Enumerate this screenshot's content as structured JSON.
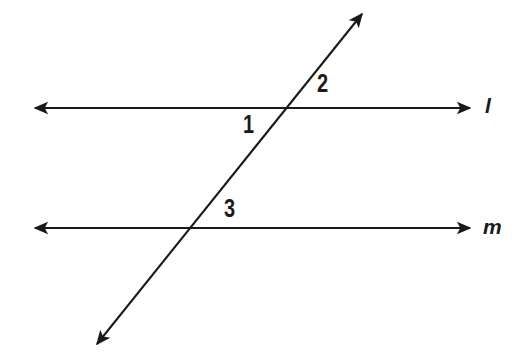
{
  "figure": {
    "type": "geometry-diagram",
    "background_color": "#ffffff",
    "stroke_color": "#1a1a1a",
    "canvas": {
      "width": 523,
      "height": 363
    }
  },
  "lines": [
    {
      "id": "line-l",
      "name": "l",
      "label": "l",
      "orientation": "horizontal",
      "label_style": "italic",
      "arrowheads": "both",
      "x1": 35,
      "y1": 108,
      "x2": 470,
      "y2": 108,
      "label_x": 485,
      "label_y": 95
    },
    {
      "id": "line-m",
      "name": "m",
      "label": "m",
      "orientation": "horizontal",
      "label_style": "italic",
      "arrowheads": "both",
      "x1": 35,
      "y1": 228,
      "x2": 470,
      "y2": 228,
      "label_x": 483,
      "label_y": 216
    },
    {
      "id": "transversal",
      "name": "transversal",
      "label": "",
      "orientation": "oblique",
      "label_style": "none",
      "arrowheads": "both",
      "x1": 97,
      "y1": 344,
      "x2": 362,
      "y2": 14,
      "label_x": 0,
      "label_y": 0
    }
  ],
  "intersections": [
    {
      "id": "intersection-l",
      "lines": "transversal-and-l",
      "x": 292,
      "y": 108
    },
    {
      "id": "intersection-m",
      "lines": "transversal-and-m",
      "x": 193,
      "y": 228
    }
  ],
  "angle_labels": [
    {
      "id": "angle-1",
      "label": "1",
      "x": 243,
      "y": 112,
      "position": "below-left-of-line-l-intersection"
    },
    {
      "id": "angle-2",
      "label": "2",
      "x": 317,
      "y": 71,
      "position": "above-right-of-line-l-intersection"
    },
    {
      "id": "angle-3",
      "label": "3",
      "x": 224,
      "y": 196,
      "position": "above-right-of-line-m-intersection"
    }
  ]
}
